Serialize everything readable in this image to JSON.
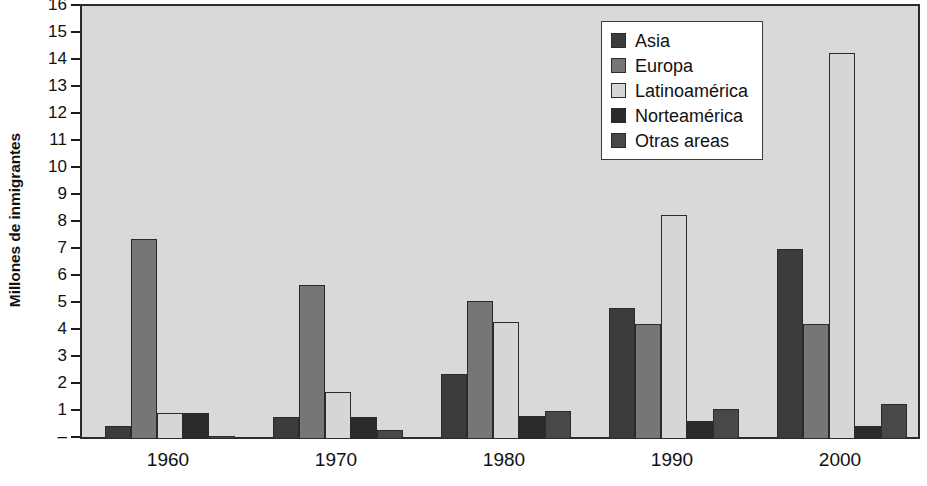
{
  "chart_data": {
    "type": "bar",
    "title": "",
    "xlabel": "",
    "ylabel": "Millones de inmigrantes",
    "categories": [
      "1960",
      "1970",
      "1980",
      "1990",
      "2000"
    ],
    "ylim": [
      0,
      16
    ],
    "yticks": [
      "–",
      "1",
      "2",
      "3",
      "4",
      "5",
      "6",
      "7",
      "8",
      "9",
      "10",
      "11",
      "12",
      "13",
      "14",
      "15",
      "16"
    ],
    "ytick_values": [
      0,
      1,
      2,
      3,
      4,
      5,
      6,
      7,
      8,
      9,
      10,
      11,
      12,
      13,
      14,
      15,
      16
    ],
    "grid": false,
    "legend_position": "top-right",
    "series": [
      {
        "name": "Asia",
        "color": "#3c3c3c",
        "values": [
          0.5,
          0.8,
          2.4,
          4.85,
          7.05
        ]
      },
      {
        "name": "Europa",
        "color": "#767676",
        "values": [
          7.4,
          5.7,
          5.1,
          4.25,
          4.25
        ]
      },
      {
        "name": "Latinoamérica",
        "color": "#d6d6d6",
        "values": [
          0.95,
          1.75,
          4.35,
          8.3,
          14.3
        ]
      },
      {
        "name": "Norteamérica",
        "color": "#2b2b2b",
        "values": [
          0.95,
          0.8,
          0.85,
          0.65,
          0.5
        ]
      },
      {
        "name": "Otras areas",
        "color": "#484848",
        "values": [
          0.1,
          0.35,
          1.05,
          1.1,
          1.3
        ]
      }
    ]
  },
  "plot": {
    "background_color": "#d9d9d9",
    "border_color": "#2b2b2b"
  }
}
